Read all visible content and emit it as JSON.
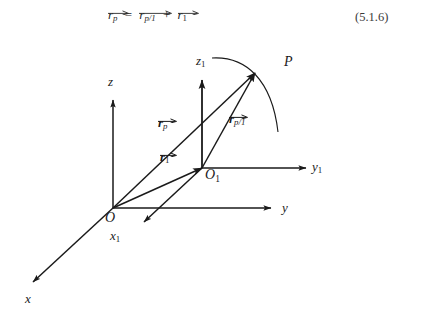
{
  "equation": {
    "lhs_vector": "r",
    "lhs_sub": "p",
    "equals": "=",
    "term1_vector": "r",
    "term1_sub": "p/1",
    "plus": "+",
    "term2_vector": "r",
    "term2_sub": "1",
    "number": "(5.1.6)"
  },
  "figure": {
    "stroke_color": "#1a1a1a",
    "labels": {
      "z": "z",
      "z1_base": "z",
      "z1_sub": "1",
      "y": "y",
      "y1_base": "y",
      "y1_sub": "1",
      "x": "x",
      "x1_base": "x",
      "x1_sub": "1",
      "origin": "O",
      "origin1_base": "O",
      "origin1_sub": "1",
      "point_p": "P",
      "vec_rp_base": "r",
      "vec_rp_sub": "p",
      "vec_rp1_base": "r",
      "vec_rp1_sub": "p/1",
      "vec_r1_base": "r",
      "vec_r1_sub": "1"
    }
  }
}
